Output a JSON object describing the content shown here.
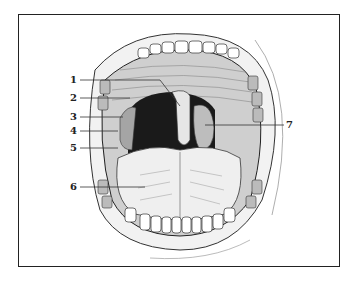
{
  "figure": {
    "labels": [
      {
        "id": "1",
        "text": "1",
        "x": 70,
        "y": 75,
        "tx": 160,
        "ty": 78,
        "ex": 180,
        "ey": 108
      },
      {
        "id": "2",
        "text": "2",
        "x": 70,
        "y": 93,
        "tx": 130,
        "ty": 97
      },
      {
        "id": "3",
        "text": "3",
        "x": 70,
        "y": 112,
        "tx": 123,
        "ty": 114
      },
      {
        "id": "4",
        "text": "4",
        "x": 70,
        "y": 126,
        "tx": 118,
        "ty": 128
      },
      {
        "id": "5",
        "text": "5",
        "x": 70,
        "y": 143,
        "tx": 118,
        "ty": 145
      },
      {
        "id": "6",
        "text": "6",
        "x": 70,
        "y": 182,
        "tx": 145,
        "ty": 186
      },
      {
        "id": "7",
        "text": "7",
        "x": 286,
        "y": 120,
        "tx": 205,
        "ty": 124
      }
    ]
  },
  "colors": {
    "ink": "#222222",
    "background": "#ffffff",
    "throat": "#1a1a1a",
    "tissue": "#d9d9d9"
  }
}
